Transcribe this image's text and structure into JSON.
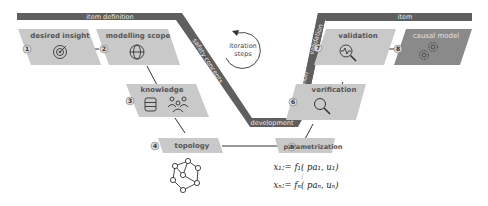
{
  "bands": {
    "item_definition": "item definition",
    "safety_concepts": "safety concepts",
    "development": "development",
    "verification": "verification",
    "validation": "validation",
    "item": "item"
  },
  "center": {
    "line1": "iteration",
    "line2": "steps"
  },
  "steps": [
    {
      "number": "1",
      "title": "desired insight",
      "icon": "target-icon"
    },
    {
      "number": "2",
      "title": "modelling scope",
      "icon": "globe-icon"
    },
    {
      "number": "3",
      "title": "knowledge",
      "icon": "database-people-icon"
    },
    {
      "number": "4",
      "title": "topology",
      "icon": "graph-network-icon"
    },
    {
      "number": "5",
      "title": "parametrization",
      "icon": "formula"
    },
    {
      "number": "6",
      "title": "verification",
      "icon": "magnifier-icon"
    },
    {
      "number": "7",
      "title": "validation",
      "icon": "magnifier-pulse-icon"
    },
    {
      "number": "8",
      "title": "causal model",
      "icon": "gears-icon"
    }
  ],
  "formula": {
    "line1": "x₁:= f₁( pa₁, u₁)",
    "dots": "⋮",
    "line2": "xₙ:= fₙ( paₙ, uₙ)"
  },
  "colors": {
    "band": "#5f5f5f",
    "box": "#c9c9c9",
    "box_dark": "#8a8a8a",
    "badge": "#d8d8d8",
    "stroke": "#333333"
  }
}
